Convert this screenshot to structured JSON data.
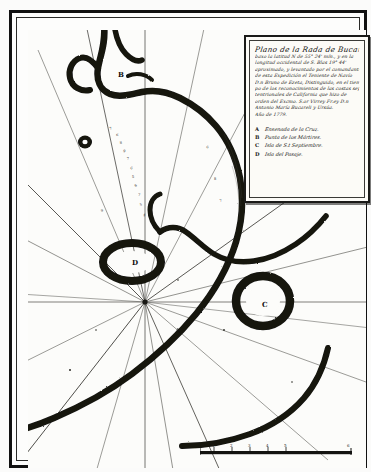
{
  "document": {
    "kind": "manuscript-nautical-chart",
    "language": "Spanish",
    "paper_color": "#fbfbfa",
    "ink_color": "#121210",
    "frame_color": "#111111"
  },
  "cartouche": {
    "title_lines": [
      "Plano de la Rada de Bucareli, situada",
      "baxo la latitud N de 55° 24' mín., y en la",
      "longitud occidental de S. Blas 19° 44'",
      "aproximado, y levantado por el comandante",
      "de esta Expedición el Teniente de Navío",
      "D.n Bruno de Ezeta, Distinguido, en el tiem-",
      "po de los reconocimientos de las costas sep-",
      "tentrionales de California que hizo de",
      "orden del Excmo. S.or Virrey Fr.ey D.n",
      "Antonio María Bucareli y Ursúa.",
      "Año de 1779."
    ],
    "legend_title": "",
    "legend": [
      {
        "key": "A",
        "label": "Ensenada de la Cruz."
      },
      {
        "key": "B",
        "label": "Punta de los Mártires."
      },
      {
        "key": "C",
        "label": "Isla de S.t Septiembre."
      },
      {
        "key": "D",
        "label": "Isla del Pasaje."
      }
    ]
  },
  "map": {
    "feature_labels": [
      {
        "key": "B",
        "x": 106,
        "y": 57
      },
      {
        "key": "D",
        "x": 120,
        "y": 245
      },
      {
        "key": "C",
        "x": 250,
        "y": 287
      },
      {
        "key": "A",
        "x": 163,
        "y": 313
      }
    ],
    "compass": {
      "center_x": 133,
      "center_y": 288,
      "rhumb_line_count": 16
    },
    "soundings": [
      {
        "x": 82,
        "y": 100,
        "v": "7"
      },
      {
        "x": 88,
        "y": 106,
        "v": "6"
      },
      {
        "x": 92,
        "y": 114,
        "v": "8"
      },
      {
        "x": 95,
        "y": 122,
        "v": "9"
      },
      {
        "x": 99,
        "y": 130,
        "v": "7"
      },
      {
        "x": 102,
        "y": 139,
        "v": "6"
      },
      {
        "x": 104,
        "y": 148,
        "v": "5"
      },
      {
        "x": 107,
        "y": 157,
        "v": "6"
      },
      {
        "x": 110,
        "y": 166,
        "v": "7"
      },
      {
        "x": 112,
        "y": 176,
        "v": "5"
      },
      {
        "x": 115,
        "y": 186,
        "v": "4"
      },
      {
        "x": 73,
        "y": 182,
        "v": "9"
      },
      {
        "x": 178,
        "y": 118,
        "v": "6"
      },
      {
        "x": 186,
        "y": 150,
        "v": "8"
      },
      {
        "x": 192,
        "y": 172,
        "v": "7"
      }
    ]
  },
  "scale_bar": {
    "unit_label": "",
    "ticks": [
      "1",
      "2",
      "3",
      "4",
      "5",
      "6"
    ],
    "length_px": 152
  }
}
